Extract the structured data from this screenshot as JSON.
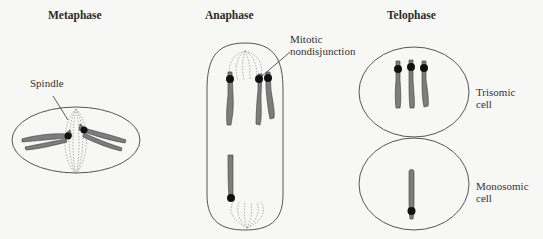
{
  "diagram": {
    "phases": [
      {
        "id": "metaphase",
        "title": "Metaphase"
      },
      {
        "id": "anaphase",
        "title": "Anaphase"
      },
      {
        "id": "telophase",
        "title": "Telophase"
      }
    ],
    "labels": {
      "spindle": "Spindle",
      "mitotic_line1": "Mitotic",
      "mitotic_line2": "nondisjunction",
      "trisomic_line1": "Trisomic",
      "trisomic_line2": "cell",
      "monosomic_line1": "Monosomic",
      "monosomic_line2": "cell"
    },
    "colors": {
      "background": "#f7f7f6",
      "cell_outline": "#555555",
      "chromosome": "#7d7d7d",
      "chromosome_outline": "#3a3a3a",
      "centromere": "#111111",
      "spindle_fiber": "#9a9a9a"
    }
  }
}
